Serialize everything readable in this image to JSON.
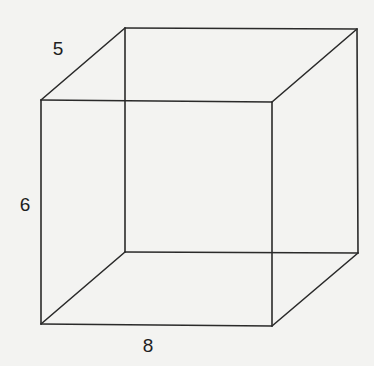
{
  "figure": {
    "type": "cube wireframe",
    "labels": {
      "depth": "5",
      "height": "6",
      "width": "8"
    },
    "stroke_color": "#2a2a2a",
    "background_color": "#f3f3f1"
  }
}
